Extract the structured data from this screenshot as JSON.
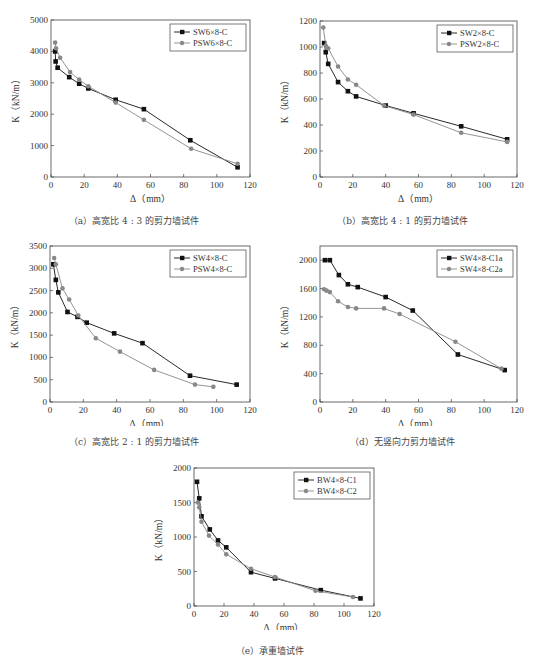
{
  "chart_data": [
    {
      "id": "a",
      "type": "line",
      "caption": "（a）高宽比 4 : 3 的剪力墙试件",
      "xlabel": "Δ（mm）",
      "ylabel": "K（kN/m）",
      "xlim": [
        0,
        120
      ],
      "ylim": [
        0,
        5000
      ],
      "xticks": [
        0,
        20,
        40,
        60,
        80,
        100,
        120
      ],
      "yticks": [
        0,
        1000,
        2000,
        3000,
        4000,
        5000
      ],
      "grid": false,
      "legend_position": "upper right",
      "series": [
        {
          "name": "SW6×8-C",
          "marker": "square",
          "color": "#111111",
          "x": [
            2.5,
            2.8,
            4,
            11,
            17,
            22.5,
            39,
            56,
            84,
            112.5
          ],
          "y": [
            4000,
            3680,
            3480,
            3180,
            2970,
            2820,
            2460,
            2160,
            1170,
            310
          ]
        },
        {
          "name": "PSW6×8-C",
          "marker": "circle",
          "color": "#888888",
          "x": [
            2.5,
            3,
            5.5,
            11.5,
            17,
            22.5,
            39,
            56,
            84.5,
            112.5
          ],
          "y": [
            4280,
            4100,
            3800,
            3340,
            3100,
            2890,
            2370,
            1820,
            900,
            420
          ]
        }
      ]
    },
    {
      "id": "b",
      "type": "line",
      "caption": "（b）高宽比 4 : 1 的剪力墙试件",
      "xlabel": "Δ（mm）",
      "ylabel": "K（kN/m）",
      "xlim": [
        0,
        120
      ],
      "ylim": [
        0,
        1200
      ],
      "xticks": [
        0,
        20,
        40,
        60,
        80,
        100,
        120
      ],
      "yticks": [
        0,
        200,
        400,
        600,
        800,
        1000,
        1200
      ],
      "grid": false,
      "legend_position": "upper right",
      "series": [
        {
          "name": "SW2×8-C",
          "marker": "square",
          "color": "#111111",
          "x": [
            2.5,
            3.5,
            5,
            11,
            17,
            22,
            40,
            57,
            86,
            114
          ],
          "y": [
            1030,
            960,
            870,
            730,
            660,
            620,
            550,
            490,
            390,
            290
          ]
        },
        {
          "name": "PSW2×8-C",
          "marker": "circle",
          "color": "#888888",
          "x": [
            2,
            3.5,
            5,
            11,
            17,
            22,
            39,
            57,
            86,
            114
          ],
          "y": [
            1150,
            1010,
            990,
            850,
            750,
            710,
            550,
            480,
            340,
            270
          ]
        }
      ]
    },
    {
      "id": "c",
      "type": "line",
      "caption": "（c）高宽比 2 : 1 的剪力墙试件",
      "xlabel": "Δ（mm）",
      "ylabel": "K（kN/m）",
      "xlim": [
        0,
        120
      ],
      "ylim": [
        0,
        3500
      ],
      "xticks": [
        0,
        20,
        40,
        60,
        80,
        100,
        120
      ],
      "yticks": [
        0,
        500,
        1000,
        1500,
        2000,
        2500,
        3000,
        3500
      ],
      "grid": false,
      "legend_position": "upper right",
      "series": [
        {
          "name": "SW4×8-C",
          "marker": "square",
          "color": "#111111",
          "x": [
            2,
            3.5,
            5,
            10.5,
            16.5,
            22,
            38.5,
            55.5,
            84,
            112
          ],
          "y": [
            3090,
            2740,
            2460,
            2020,
            1910,
            1780,
            1540,
            1320,
            590,
            390
          ]
        },
        {
          "name": "PSW4×8-C",
          "marker": "circle",
          "color": "#888888",
          "x": [
            2.5,
            3.5,
            7.5,
            11.5,
            17,
            27.5,
            42,
            62.5,
            87,
            98
          ],
          "y": [
            3230,
            3090,
            2550,
            2300,
            1940,
            1430,
            1130,
            720,
            390,
            340
          ]
        }
      ]
    },
    {
      "id": "d",
      "type": "line",
      "caption": "（d）无竖向力剪力墙试件",
      "xlabel": "Δ（mm）",
      "ylabel": "K（kN/m）",
      "xlim": [
        0,
        120
      ],
      "ylim": [
        0,
        2200
      ],
      "xticks": [
        0,
        20,
        40,
        60,
        80,
        100,
        120
      ],
      "yticks": [
        0,
        400,
        800,
        1200,
        1600,
        2000
      ],
      "grid": false,
      "legend_position": "upper right",
      "series": [
        {
          "name": "SW4×8-C1a",
          "marker": "square",
          "color": "#111111",
          "x": [
            3,
            6,
            11.5,
            17,
            23,
            40,
            56.5,
            84,
            112.5
          ],
          "y": [
            2000,
            2000,
            1790,
            1660,
            1620,
            1480,
            1290,
            670,
            450
          ]
        },
        {
          "name": "SW4×8-C2a",
          "marker": "circle",
          "color": "#888888",
          "x": [
            2.5,
            4,
            6,
            11,
            17,
            22,
            39,
            48.5,
            82.5,
            110.5
          ],
          "y": [
            1590,
            1570,
            1550,
            1420,
            1340,
            1320,
            1320,
            1240,
            850,
            470
          ]
        }
      ]
    },
    {
      "id": "e",
      "type": "line",
      "caption": "（e）承重墙试件",
      "xlabel": "Δ（mm）",
      "ylabel": "K（kN/m）",
      "xlim": [
        0,
        120
      ],
      "ylim": [
        0,
        2000
      ],
      "xticks": [
        0,
        20,
        40,
        60,
        80,
        100,
        120
      ],
      "yticks": [
        0,
        500,
        1000,
        1500,
        2000
      ],
      "grid": false,
      "legend_position": "upper right",
      "series": [
        {
          "name": "BW4×8-C1",
          "marker": "square",
          "color": "#111111",
          "x": [
            2,
            3.5,
            5,
            10.5,
            16,
            21.5,
            38,
            54,
            84.5,
            111
          ],
          "y": [
            1800,
            1560,
            1300,
            1110,
            950,
            850,
            490,
            400,
            230,
            110
          ]
        },
        {
          "name": "BW4×8-C2",
          "marker": "circle",
          "color": "#888888",
          "x": [
            2.5,
            3.5,
            5,
            10,
            16,
            21.5,
            38,
            54,
            81,
            106
          ],
          "y": [
            1500,
            1430,
            1220,
            1020,
            890,
            750,
            540,
            420,
            220,
            130
          ]
        }
      ]
    }
  ]
}
